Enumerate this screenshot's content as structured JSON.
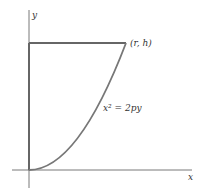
{
  "diagram": {
    "axes": {
      "x_label": "x",
      "y_label": "y"
    },
    "point_label": "(r, h)",
    "curve_equation": "x² = 2py",
    "colors": {
      "axis": "#555555",
      "shape_edges": "#666666",
      "curve": "#777777",
      "text": "#333333"
    }
  }
}
